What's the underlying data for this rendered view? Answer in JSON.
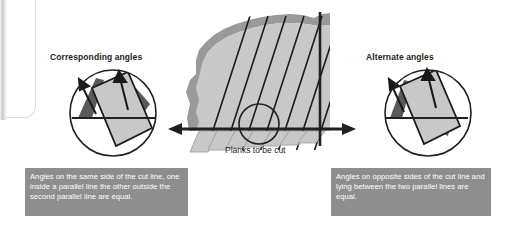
{
  "figure": {
    "title_left": "Corresponding angles",
    "title_right": "Alternate angles",
    "caption_center": "Planks to be cut",
    "note_left": "Angles on the same side of the cut line, one inside a parallel line the other outside the second parallel line are equal.",
    "note_right": "Angles on opposite sides of the cut line and lying between the two parallel lines are equal.",
    "colors": {
      "note_background": "#8e8e8e",
      "note_text": "#ffffff",
      "plank_fill": "#c8c8c8",
      "plank_edge": "#1a1a1a",
      "rough_edge": "#9a9a9a",
      "angle_shade": "#5a5a5a",
      "line": "#231f20",
      "heading_text": "#231f20"
    },
    "detail_left": {
      "name": "corresponding-angles-detail",
      "shaded_angles": 2,
      "arrows": 2,
      "angle_relation": "same side of cut line"
    },
    "detail_right": {
      "name": "alternate-angles-detail",
      "shaded_angles": 2,
      "arrows": 2,
      "angle_relation": "opposite sides of cut line"
    },
    "center_diagram": {
      "name": "planks-to-be-cut",
      "plank_count": 7,
      "cut_line_orientation": "vertical",
      "reference_line_orientation": "horizontal",
      "highlight_circle": true
    },
    "arrows": {
      "left_pointer": "points to corresponding angles detail",
      "right_pointer": "points to alternate angles detail"
    }
  }
}
